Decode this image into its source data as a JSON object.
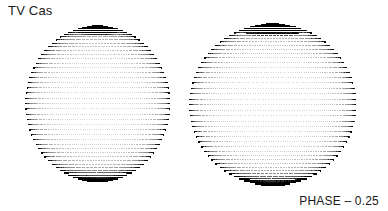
{
  "figure": {
    "title": "TV Cas",
    "phase_label": "PHASE – 0.25",
    "background_color": "#ffffff",
    "ink_color": "#000000",
    "width": 388,
    "height": 211
  },
  "chart_data": {
    "type": "scatter",
    "title": "TV Cas",
    "subtitle": "",
    "xlabel": "",
    "ylabel": "",
    "annotations": [
      {
        "text": "TV Cas",
        "position": "top-left"
      },
      {
        "text": "PHASE – 0.25",
        "position": "bottom-right"
      }
    ],
    "legend": [],
    "grid": false,
    "series": [
      {
        "name": "primary-component",
        "label": "Left stellar surface model",
        "shape": "oblate-sphere",
        "center_x": 97,
        "center_y": 103,
        "radius_x": 72,
        "radius_y": 78,
        "dot_count": 4400,
        "mesh_latitudes": 46,
        "mesh_longitudes": 96,
        "limb_darkening": 0.55,
        "spot": {
          "name": "polar-starspot",
          "center_longitude_deg": 0,
          "center_latitude_deg": 76,
          "angular_radius_deg": 17,
          "darkness": 0.92
        }
      },
      {
        "name": "secondary-component",
        "label": "Right stellar surface model",
        "shape": "oblate-sphere",
        "center_x": 272,
        "center_y": 104,
        "radius_x": 83,
        "radius_y": 81,
        "dot_count": 4800,
        "mesh_latitudes": 46,
        "mesh_longitudes": 100,
        "limb_darkening": 0.55,
        "spot": {
          "name": "polar-starspot",
          "center_longitude_deg": 0,
          "center_latitude_deg": 78,
          "angular_radius_deg": 22,
          "darkness": 0.95
        }
      }
    ]
  }
}
